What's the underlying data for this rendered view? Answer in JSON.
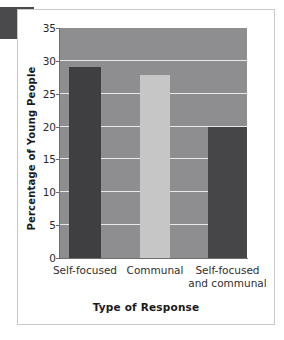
{
  "chart_data": {
    "type": "bar",
    "title": "",
    "subtitle": "",
    "xlabel": "Type of Response",
    "ylabel": "Percentage of Young People",
    "categories": [
      "Self-focused",
      "Communal",
      "Self-focused and communal"
    ],
    "category_lines": [
      [
        "Self-focused"
      ],
      [
        "Communal"
      ],
      [
        "Self-focused",
        "and communal"
      ]
    ],
    "values": [
      29,
      27.8,
      20
    ],
    "ylim": [
      0,
      35
    ],
    "yticks": [
      0,
      5,
      10,
      15,
      20,
      25,
      30,
      35
    ],
    "ytick_labels": [
      "0",
      "5",
      "10",
      "15",
      "20",
      "25",
      "30",
      "35"
    ],
    "grid": true,
    "grid_axis": "y",
    "legend": "none",
    "bar_colors": [
      "#3f3f42",
      "#c6c6c6",
      "#464649"
    ],
    "plot_background": "#8e8e90",
    "gridline_color": "#e8e8e8",
    "axis_color": "#6f6f6f"
  },
  "figure": {
    "background": "#ffffff",
    "card_border_color": "#c9c9c9",
    "page_tab_color": "#4a4a4d"
  }
}
